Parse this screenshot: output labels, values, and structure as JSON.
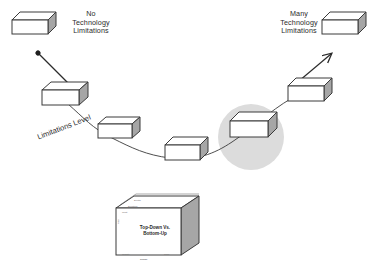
{
  "diagram": {
    "background_color": "#ffffff",
    "box_face_color": "#ffffff",
    "box_side_color": "#a6a6a6",
    "box_top_color": "#ffffff",
    "outline_color": "#3a3a3a",
    "highlight_circle_color": "#dcdcdc",
    "curve_color": "#3a3a3a"
  },
  "labels": {
    "left_endpoint": "No\nTechnology\nLimitations",
    "right_endpoint": "Many\nTechnology\nLimitations",
    "axis_curve": "Limitations Level"
  },
  "bottom_box": {
    "title": "Top-Down Vs.\nBottom-Up",
    "edges": {
      "top_far": "Depth",
      "top_near": "Duration",
      "left_upper": "Cost",
      "left_mid": "Risk",
      "bottom_left": "Quality",
      "bottom_right": "Time",
      "bottom_center": "Scope"
    }
  },
  "curve_boxes": [
    {
      "name": "endpoint-left",
      "x": 12,
      "y": 12,
      "w": 36,
      "h": 22
    },
    {
      "name": "step-1",
      "x": 42,
      "y": 82,
      "w": 38,
      "h": 23
    },
    {
      "name": "step-2",
      "x": 98,
      "y": 117,
      "w": 35,
      "h": 21
    },
    {
      "name": "step-3",
      "x": 165,
      "y": 137,
      "w": 36,
      "h": 22
    },
    {
      "name": "step-highlighted",
      "x": 230,
      "y": 112,
      "w": 40,
      "h": 24
    },
    {
      "name": "step-4",
      "x": 288,
      "y": 78,
      "w": 37,
      "h": 22
    },
    {
      "name": "endpoint-right",
      "x": 322,
      "y": 12,
      "w": 36,
      "h": 22
    }
  ],
  "arrows": {
    "left": {
      "from_x": 68,
      "from_y": 82,
      "to_x": 37,
      "to_y": 52,
      "style": "solid-head"
    },
    "right": {
      "from_x": 300,
      "from_y": 80,
      "to_x": 331,
      "to_y": 54,
      "style": "open-head"
    }
  },
  "highlight": {
    "cx": 251,
    "cy": 137,
    "r": 33
  }
}
